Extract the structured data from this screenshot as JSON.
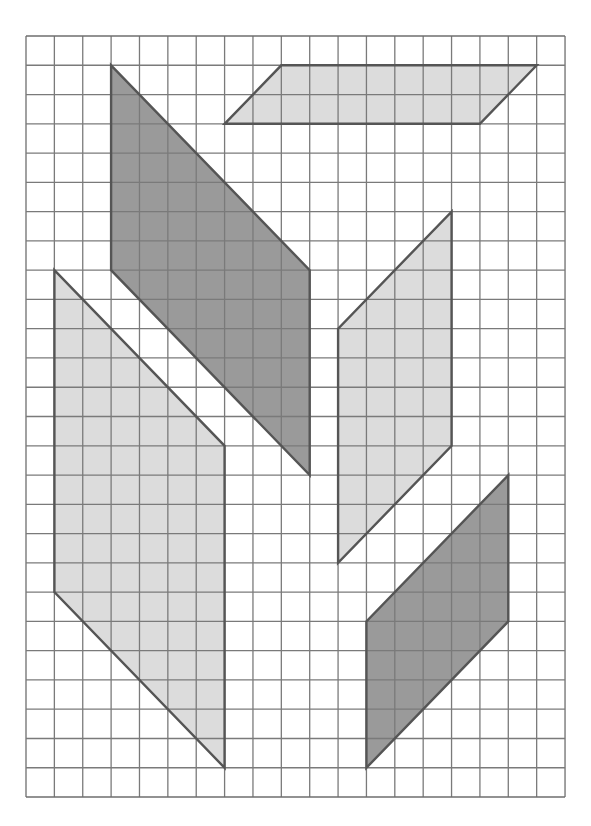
{
  "grid": {
    "columns": 19,
    "rows": 26,
    "origin_px": [
      26,
      36
    ],
    "cell_w": 28.37,
    "cell_h": 29.27,
    "line_color": "#7a7a7a",
    "border_color": "#6e6e6e"
  },
  "colors": {
    "dark_fill": "#9a9a9a",
    "light_fill": "#dcdcdc",
    "outline": "#555555"
  },
  "shapes": [
    {
      "name": "parallelogram-top-horizontal",
      "shade": "light",
      "points": [
        [
          9,
          1
        ],
        [
          18,
          1
        ],
        [
          16,
          3
        ],
        [
          7,
          3
        ]
      ]
    },
    {
      "name": "parallelogram-dark-upper-left",
      "shade": "dark",
      "points": [
        [
          3,
          1
        ],
        [
          10,
          8
        ],
        [
          10,
          15
        ],
        [
          3,
          8
        ]
      ]
    },
    {
      "name": "parallelogram-light-left",
      "shade": "light",
      "points": [
        [
          1,
          8
        ],
        [
          7,
          14
        ],
        [
          7,
          25
        ],
        [
          1,
          19
        ]
      ]
    },
    {
      "name": "parallelogram-light-middle-right",
      "shade": "light",
      "points": [
        [
          15,
          6
        ],
        [
          15,
          14
        ],
        [
          11,
          18
        ],
        [
          11,
          10
        ]
      ]
    },
    {
      "name": "parallelogram-dark-lower-right",
      "shade": "dark",
      "points": [
        [
          17,
          15
        ],
        [
          17,
          20
        ],
        [
          12,
          25
        ],
        [
          12,
          20
        ]
      ]
    }
  ]
}
